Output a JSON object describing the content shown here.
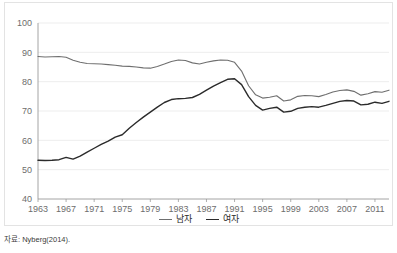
{
  "source_note": "자료: Nyberg(2014).",
  "legend": {
    "position": "bottom-center",
    "items": [
      {
        "label": "남자",
        "color": "#6f6f6f"
      },
      {
        "label": "여자",
        "color": "#2b2b2b"
      }
    ]
  },
  "chart_data": {
    "type": "line",
    "title": "",
    "xlabel": "",
    "ylabel": "",
    "grid": true,
    "xlim": [
      1963,
      2013
    ],
    "ylim": [
      40,
      100
    ],
    "ytick_labels": [
      "40",
      "50",
      "60",
      "70",
      "80",
      "90",
      "100"
    ],
    "yticks": [
      40,
      50,
      60,
      70,
      80,
      90,
      100
    ],
    "xtick_labels": [
      "1963",
      "1967",
      "1971",
      "1975",
      "1979",
      "1983",
      "1987",
      "1991",
      "1995",
      "1999",
      "2003",
      "2007",
      "2011"
    ],
    "xticks": [
      1963,
      1967,
      1971,
      1975,
      1979,
      1983,
      1987,
      1991,
      1995,
      1999,
      2003,
      2007,
      2011
    ],
    "x": [
      1963,
      1964,
      1965,
      1966,
      1967,
      1968,
      1969,
      1970,
      1971,
      1972,
      1973,
      1974,
      1975,
      1976,
      1977,
      1978,
      1979,
      1980,
      1981,
      1982,
      1983,
      1984,
      1985,
      1986,
      1987,
      1988,
      1989,
      1990,
      1991,
      1992,
      1993,
      1994,
      1995,
      1996,
      1997,
      1998,
      1999,
      2000,
      2001,
      2002,
      2003,
      2004,
      2005,
      2006,
      2007,
      2008,
      2009,
      2010,
      2011,
      2012,
      2013
    ],
    "series": [
      {
        "name": "남자",
        "color": "#6f6f6f",
        "values": [
          88.6,
          88.4,
          88.5,
          88.6,
          88.3,
          87.3,
          86.6,
          86.2,
          86.1,
          86.0,
          85.8,
          85.6,
          85.3,
          85.2,
          85.0,
          84.7,
          84.6,
          85.2,
          86.0,
          86.9,
          87.4,
          87.2,
          86.4,
          86.0,
          86.6,
          87.1,
          87.4,
          87.3,
          86.6,
          83.6,
          78.6,
          75.5,
          74.4,
          74.7,
          75.2,
          73.4,
          73.8,
          75.0,
          75.3,
          75.2,
          74.9,
          75.6,
          76.5,
          77.0,
          77.2,
          76.7,
          75.4,
          75.9,
          76.6,
          76.4,
          77.1
        ]
      },
      {
        "name": "여자",
        "color": "#2b2b2b",
        "values": [
          53.2,
          53.1,
          53.2,
          53.4,
          54.2,
          53.6,
          54.6,
          56.0,
          57.3,
          58.6,
          59.7,
          61.1,
          61.9,
          64.1,
          66.1,
          67.9,
          69.6,
          71.3,
          72.9,
          73.9,
          74.2,
          74.3,
          74.6,
          75.7,
          77.1,
          78.5,
          79.7,
          80.8,
          81.0,
          79.0,
          74.9,
          71.9,
          70.3,
          70.9,
          71.3,
          69.6,
          69.9,
          70.9,
          71.3,
          71.5,
          71.3,
          71.9,
          72.6,
          73.3,
          73.6,
          73.4,
          72.1,
          72.3,
          73.0,
          72.6,
          73.3
        ]
      }
    ]
  }
}
